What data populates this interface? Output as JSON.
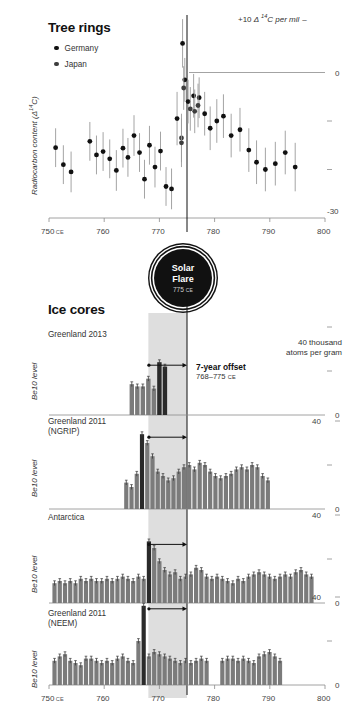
{
  "top": {
    "title": "Tree rings",
    "legend": [
      {
        "label": "Germany",
        "color": "#111111"
      },
      {
        "label": "Japan",
        "color": "#3d3d3d"
      }
    ],
    "ylabel": "Radiocarbon content (Δ 14C)",
    "corner_note_prefix": "+10 ",
    "corner_note_delta": "Δ ",
    "corner_note_iso": "14",
    "corner_note_suffix": "C per mil",
    "zero_label": "0",
    "bottom_label": "-30",
    "x_ticks": [
      "750",
      "760",
      "770",
      "780",
      "790",
      "800"
    ],
    "x_first_suffix": "CE"
  },
  "flare": {
    "line1": "Solar",
    "line2": "Flare",
    "year": "775",
    "era": "CE"
  },
  "bottom": {
    "title": "Ice cores",
    "units_line1": "40 thousand",
    "units_line2": "atoms per gram",
    "offset_note_bold": "7-year offset",
    "offset_note_sub": "768–775 ",
    "offset_note_era": "CE",
    "x_ticks": [
      "750",
      "760",
      "770",
      "780",
      "790",
      "800"
    ],
    "x_first_suffix": "CE",
    "panels": [
      {
        "name": "Greenland 2013",
        "name2": "",
        "ylabel": "Be10 level",
        "tick_top": "",
        "tick_zero": "0"
      },
      {
        "name": "Greenland 2011",
        "name2": "(NGRIP)",
        "ylabel": "Be10 level",
        "tick_top": "40",
        "tick_zero": "0"
      },
      {
        "name": "Antarctica",
        "name2": "",
        "ylabel": "Be10 level",
        "tick_top": "40",
        "tick_zero": "0"
      },
      {
        "name": "Greenland 2011",
        "name2": "(NEEM)",
        "ylabel": "Be10 level",
        "tick_top": "40",
        "tick_zero": "0"
      }
    ]
  },
  "colors": {
    "bar": "#7b7b7b",
    "bar_highlight": "#2a2a2a",
    "band": "#c9c9c9",
    "axis": "#8c8c8c",
    "marker": "#111111"
  },
  "chart_data": {
    "type": "scatter",
    "title": "Tree rings",
    "xlabel": "Year (CE)",
    "ylabel": "Radiocarbon content (Δ 14C)",
    "xlim": [
      750,
      800
    ],
    "ylim": [
      -30,
      10
    ],
    "grid": false,
    "legend": [
      "Germany",
      "Japan"
    ],
    "annotations": [
      "+10 Δ 14C per mil",
      "0",
      "-30",
      "Solar Flare 775 CE"
    ],
    "series": [
      {
        "name": "Germany",
        "x": [
          751.2,
          752.6,
          754.0,
          757.4,
          758.6,
          759.8,
          761.0,
          762.2,
          763.4,
          764.3,
          765.4,
          766.4,
          767.3,
          768.2,
          769.2,
          770.2,
          771.2,
          772.2,
          773.2,
          774.2,
          774.6,
          775.2,
          776.2,
          777.2,
          778.2,
          779.2,
          780.4,
          781.6,
          783.0,
          784.6,
          786.2,
          787.6,
          789.2,
          791.0,
          792.8,
          794.6
        ],
        "y": [
          -15.5,
          -19.0,
          -20.5,
          -14.2,
          -17.0,
          -16.3,
          -17.8,
          -20.2,
          -15.6,
          -17.5,
          -13.0,
          -16.5,
          -22.0,
          -15.0,
          -19.5,
          -16.2,
          -23.5,
          -24.0,
          -9.5,
          6.0,
          -1.5,
          -6.0,
          -4.8,
          -5.2,
          -8.5,
          -11.5,
          -10.0,
          -9.0,
          -13.0,
          -11.8,
          -16.0,
          -18.5,
          -20.0,
          -18.8,
          -16.5,
          -19.5
        ],
        "yerr": [
          4.0,
          4.0,
          4.2,
          4.0,
          4.0,
          4.0,
          4.0,
          4.2,
          4.0,
          4.0,
          4.2,
          4.0,
          4.0,
          4.0,
          4.2,
          4.0,
          4.0,
          4.2,
          5.5,
          5.0,
          4.5,
          4.5,
          4.5,
          4.2,
          4.5,
          4.5,
          4.5,
          4.5,
          4.5,
          4.5,
          4.5,
          4.5,
          4.5,
          4.5,
          4.5,
          5.0
        ]
      },
      {
        "name": "Japan",
        "x": [
          774.0,
          774.0,
          774.4,
          775.6,
          776.4,
          777.0
        ],
        "y": [
          -13.5,
          -14.5,
          -3.2,
          -7.5,
          -8.0,
          -6.8
        ],
        "yerr": [
          5.0,
          5.0,
          4.5,
          4.5,
          4.5,
          4.5
        ]
      }
    ]
  },
  "ice_core_data": {
    "type": "bar",
    "xlim": [
      750,
      800
    ],
    "highlight_band": [
      768,
      775
    ],
    "event_line": 775,
    "panels": [
      {
        "name": "Greenland 2013",
        "ylabel": "Be10 level",
        "x_start": 765.0,
        "bar_step": 1.0,
        "values": [
          14,
          13,
          13,
          16.5,
          12,
          24,
          22
        ],
        "highlight_index": [
          5,
          6
        ]
      },
      {
        "name": "Greenland 2011 (NGRIP)",
        "ylabel": "Be10 level",
        "x_start": 764.0,
        "bar_step": 0.95,
        "values": [
          12,
          10,
          16,
          34,
          30,
          24,
          17,
          15,
          13,
          14,
          17,
          19,
          20,
          18,
          21,
          20,
          17,
          15,
          14,
          15,
          16,
          18,
          19,
          18,
          20,
          19,
          15,
          13
        ],
        "highlight_index": [
          3
        ]
      },
      {
        "name": "Antarctica",
        "ylabel": "Be10 level",
        "x_start": 751.0,
        "bar_step": 0.95,
        "values": [
          9,
          10,
          9,
          10,
          9,
          11,
          10,
          11,
          10,
          10,
          11,
          10,
          11,
          12,
          11,
          10,
          12,
          11,
          28,
          25,
          19,
          15,
          13,
          14,
          11,
          12,
          13,
          16,
          15,
          12,
          11,
          12,
          11,
          10,
          9,
          11,
          10,
          12,
          13,
          14,
          13,
          12,
          11,
          12,
          13,
          12,
          14,
          15,
          13,
          12
        ],
        "highlight_index": [
          18
        ]
      },
      {
        "name": "Greenland 2011 (NEEM)",
        "ylabel": "Be10 level",
        "x_start": 751.0,
        "bar_step": 0.95,
        "values": [
          11,
          13,
          14,
          11,
          10,
          9,
          12,
          12,
          11,
          10,
          11,
          10,
          12,
          13,
          11,
          10,
          20,
          36,
          13,
          15,
          14,
          13,
          12,
          11,
          10,
          11,
          10,
          11,
          12,
          11,
          0,
          0,
          11,
          12,
          12,
          11,
          12,
          11,
          10,
          13,
          14,
          15,
          13,
          11,
          0,
          0,
          0,
          0,
          0,
          0
        ],
        "highlight_index": [
          17
        ]
      }
    ]
  }
}
